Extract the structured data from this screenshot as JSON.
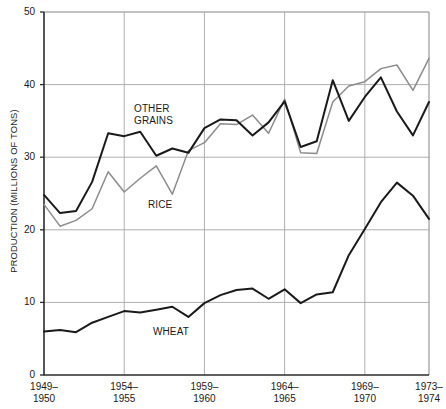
{
  "chart_data": {
    "type": "line",
    "title": "",
    "xlabel": "",
    "ylabel": "PRODUCTION (MILLIONS OF TONS)",
    "ylim": [
      0,
      50
    ],
    "yticks": [
      0,
      10,
      20,
      30,
      40,
      50
    ],
    "ytick_labels": [
      "0",
      "10",
      "20",
      "30",
      "40",
      "50"
    ],
    "grid": true,
    "legend_position": "inline-annotations",
    "x": [
      "1949-1950",
      "1950-1951",
      "1951-1952",
      "1952-1953",
      "1953-1954",
      "1954-1955",
      "1955-1956",
      "1956-1957",
      "1957-1958",
      "1958-1959",
      "1959-1960",
      "1960-1961",
      "1961-1962",
      "1962-1963",
      "1963-1964",
      "1964-1965",
      "1965-1966",
      "1966-1967",
      "1967-1968",
      "1968-1969",
      "1969-1970",
      "1970-1971",
      "1971-1972",
      "1972-1973",
      "1973-1974"
    ],
    "xticks": [
      "1949-1950",
      "1954-1955",
      "1959-1960",
      "1964-1965",
      "1969-1970",
      "1973-1974"
    ],
    "xtick_labels": [
      {
        "top": "1949–",
        "bottom": "1950"
      },
      {
        "top": "1954–",
        "bottom": "1955"
      },
      {
        "top": "1959–",
        "bottom": "1960"
      },
      {
        "top": "1964–",
        "bottom": "1965"
      },
      {
        "top": "1969–",
        "bottom": "1970"
      },
      {
        "top": "1973–",
        "bottom": "1974"
      }
    ],
    "series": [
      {
        "name": "OTHER GRAINS",
        "color": "#1a1a1a",
        "label_lines": [
          "OTHER",
          "GRAINS"
        ],
        "values": [
          24.8,
          22.3,
          22.6,
          26.6,
          33.3,
          32.9,
          33.5,
          30.2,
          31.2,
          30.6,
          34.0,
          35.2,
          35.1,
          33.0,
          34.8,
          37.7,
          31.4,
          32.2,
          40.6,
          35.0,
          38.3,
          41.0,
          36.3,
          33.0,
          37.6
        ]
      },
      {
        "name": "RICE",
        "color": "#8c8c8c",
        "label_lines": [
          "RICE"
        ],
        "values": [
          23.5,
          20.5,
          21.3,
          22.9,
          28.0,
          25.2,
          27.1,
          28.8,
          24.9,
          30.9,
          32.0,
          34.6,
          34.5,
          35.8,
          33.3,
          38.0,
          30.6,
          30.5,
          37.6,
          39.8,
          40.4,
          42.2,
          42.7,
          39.2,
          43.6
        ]
      },
      {
        "name": "WHEAT",
        "color": "#1a1a1a",
        "label_lines": [
          "WHEAT"
        ],
        "values": [
          6.0,
          6.2,
          5.9,
          7.2,
          8.0,
          8.8,
          8.6,
          9.0,
          9.4,
          8.0,
          9.9,
          11.0,
          11.7,
          11.9,
          10.5,
          11.8,
          9.9,
          11.1,
          11.4,
          16.5,
          20.1,
          23.8,
          26.5,
          24.7,
          21.5
        ]
      }
    ],
    "annotations": [
      {
        "name": "other-grains-label",
        "text_lines": [
          "OTHER",
          "GRAINS"
        ],
        "x_px": 134,
        "y_px": 103
      },
      {
        "name": "rice-label",
        "text_lines": [
          "RICE"
        ],
        "x_px": 148,
        "y_px": 199
      },
      {
        "name": "wheat-label",
        "text_lines": [
          "WHEAT"
        ],
        "x_px": 153,
        "y_px": 326
      }
    ]
  },
  "geometry": {
    "plot_left_px": 44,
    "plot_right_px": 429,
    "plot_top_px": 12,
    "plot_bottom_px": 375,
    "gridline_color": "#a6a6a6",
    "axis_color": "#2b2b2b"
  }
}
